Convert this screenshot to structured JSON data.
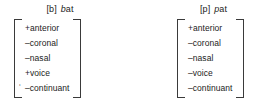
{
  "figure": {
    "background_color": "#ffffff",
    "text_color": "#1b1b1b",
    "bracket_color": "#3a3a3a"
  },
  "matrices": [
    {
      "id": "matrix-b",
      "header": {
        "segment": "[b]",
        "word_initial": "b",
        "word_rest": "at"
      },
      "features": [
        {
          "value": "+anterior"
        },
        {
          "value": "–coronal"
        },
        {
          "value": "–nasal"
        },
        {
          "value": "+voice"
        },
        {
          "value": "–continuant",
          "stray_mark": "‘"
        }
      ]
    },
    {
      "id": "matrix-p",
      "header": {
        "segment": "[p]",
        "word_initial": "p",
        "word_rest": "at"
      },
      "features": [
        {
          "value": "+anterior"
        },
        {
          "value": "–coronal"
        },
        {
          "value": "–nasal"
        },
        {
          "value": "–voice"
        },
        {
          "value": "–continuant"
        }
      ]
    }
  ]
}
